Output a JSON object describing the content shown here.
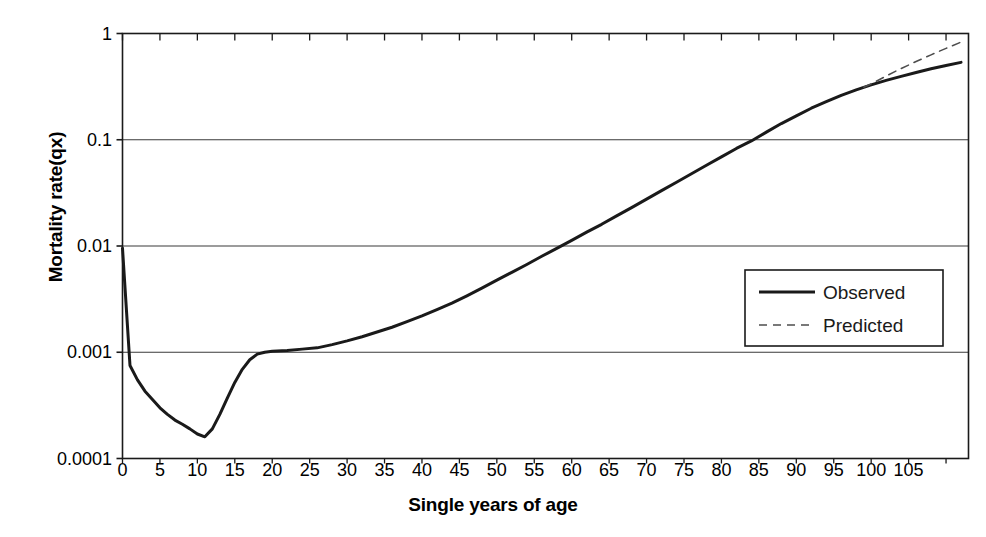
{
  "chart_data": {
    "type": "line",
    "title": "",
    "xlabel": "Single years of age",
    "ylabel": "Mortality rate(qx)",
    "yscale": "log",
    "ylim": [
      0.0001,
      1
    ],
    "xlim": [
      0,
      113
    ],
    "grid": "horizontal",
    "legend_position": "right-middle",
    "y_tick_labels": [
      "1",
      "0.1",
      "0.01",
      "0.001",
      "0.0001"
    ],
    "y_tick_values": [
      1,
      0.1,
      0.01,
      0.001,
      0.0001
    ],
    "x_tick_labels": [
      "0",
      "5",
      "10",
      "15",
      "20",
      "25",
      "30",
      "35",
      "40",
      "45",
      "50",
      "55",
      "60",
      "65",
      "70",
      "75",
      "80",
      "85",
      "90",
      "95",
      "100",
      "105"
    ],
    "x_tick_values": [
      0,
      5,
      10,
      15,
      20,
      25,
      30,
      35,
      40,
      45,
      50,
      55,
      60,
      65,
      70,
      75,
      80,
      85,
      90,
      95,
      100,
      105
    ],
    "series": [
      {
        "name": "Observed",
        "style": "solid",
        "color": "#1a1a1a",
        "x": [
          0,
          1,
          2,
          3,
          4,
          5,
          6,
          7,
          8,
          9,
          10,
          11,
          12,
          13,
          14,
          15,
          16,
          17,
          18,
          19,
          20,
          22,
          24,
          26,
          28,
          30,
          32,
          34,
          36,
          38,
          40,
          42,
          44,
          46,
          48,
          50,
          52,
          54,
          56,
          58,
          60,
          62,
          64,
          66,
          68,
          70,
          72,
          74,
          76,
          78,
          80,
          82,
          84,
          86,
          88,
          90,
          92,
          94,
          96,
          98,
          100,
          102,
          104,
          106,
          108,
          110,
          112
        ],
        "y": [
          0.0095,
          0.00075,
          0.00055,
          0.00043,
          0.00036,
          0.0003,
          0.00026,
          0.00023,
          0.00021,
          0.00019,
          0.00017,
          0.00016,
          0.00019,
          0.00026,
          0.00037,
          0.00052,
          0.00069,
          0.00085,
          0.00096,
          0.001,
          0.00102,
          0.00104,
          0.00107,
          0.0011,
          0.00118,
          0.00128,
          0.0014,
          0.00155,
          0.00172,
          0.00194,
          0.0022,
          0.00252,
          0.0029,
          0.0034,
          0.00402,
          0.00478,
          0.00565,
          0.0067,
          0.008,
          0.0095,
          0.0113,
          0.0135,
          0.016,
          0.0192,
          0.023,
          0.0276,
          0.0332,
          0.0398,
          0.0478,
          0.0575,
          0.069,
          0.0828,
          0.0975,
          0.118,
          0.142,
          0.168,
          0.198,
          0.228,
          0.262,
          0.295,
          0.328,
          0.362,
          0.395,
          0.43,
          0.465,
          0.5,
          0.535
        ]
      },
      {
        "name": "Predicted",
        "style": "dashed",
        "color": "#4d4d4d",
        "x": [
          99,
          100,
          102,
          104,
          106,
          108,
          110,
          112
        ],
        "y": [
          0.312,
          0.335,
          0.398,
          0.468,
          0.545,
          0.63,
          0.725,
          0.83
        ]
      }
    ]
  },
  "legend": {
    "items": [
      {
        "label": "Observed",
        "style": "solid"
      },
      {
        "label": "Predicted",
        "style": "dashed"
      }
    ]
  }
}
